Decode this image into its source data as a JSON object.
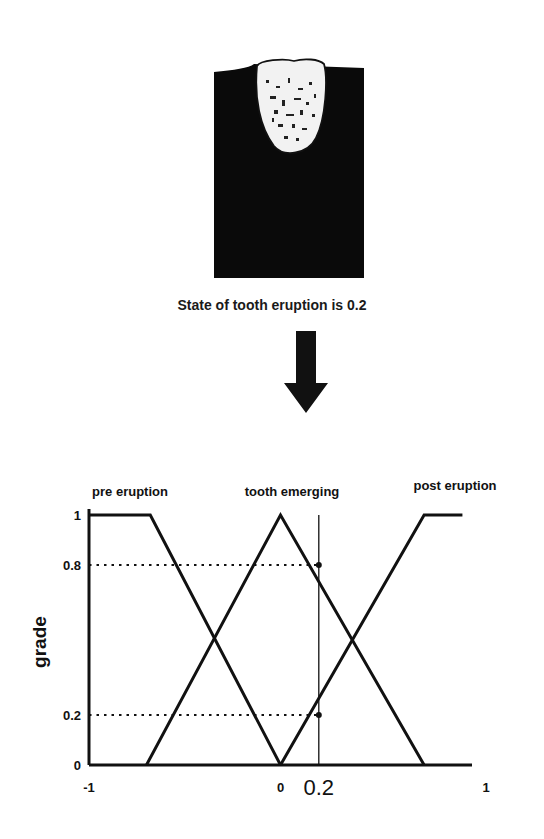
{
  "figure": {
    "image_description": "tooth partially emerging from gum (radiograph-style)",
    "caption": "State of tooth eruption is 0.2",
    "arrow_icon": "down-arrow-icon"
  },
  "chart_data": {
    "type": "line",
    "title": "",
    "xlabel": "",
    "ylabel": "grade",
    "xlim": [
      -1,
      1
    ],
    "ylim": [
      0,
      1
    ],
    "grid": false,
    "x_ticks": [
      {
        "value": -1,
        "label": "-1"
      },
      {
        "value": 0,
        "label": "0"
      },
      {
        "value": 1,
        "label": "1"
      }
    ],
    "y_ticks": [
      {
        "value": 0,
        "label": "0"
      },
      {
        "value": 0.2,
        "label": "0.2"
      },
      {
        "value": 0.8,
        "label": "0.8"
      },
      {
        "value": 1,
        "label": "1"
      }
    ],
    "series": [
      {
        "name": "pre eruption",
        "x": [
          -1,
          -0.68,
          0
        ],
        "y": [
          1,
          1,
          0
        ]
      },
      {
        "name": "tooth emerging",
        "x": [
          -0.7,
          0,
          0.75
        ],
        "y": [
          0,
          1,
          0
        ]
      },
      {
        "name": "post eruption",
        "x": [
          0,
          0.75,
          0.95
        ],
        "y": [
          0,
          1,
          1
        ]
      }
    ],
    "annotations": [
      {
        "type": "vline",
        "x": 0.2,
        "label": "0.2"
      },
      {
        "type": "hline-dotted",
        "y": 0.8,
        "x_end": 0.2
      },
      {
        "type": "hline-dotted",
        "y": 0.2,
        "x_end": 0.2
      }
    ]
  }
}
